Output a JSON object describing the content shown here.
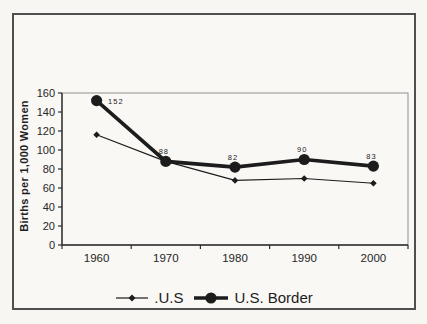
{
  "chart_data": {
    "type": "line",
    "categories": [
      "1960",
      "1970",
      "1980",
      "1990",
      "2000"
    ],
    "series": [
      {
        "name": ".U.S",
        "values": [
          116,
          88,
          68,
          70,
          65
        ],
        "marker": "diamond",
        "line_width": 1.2,
        "show_labels": false
      },
      {
        "name": "U.S. Border",
        "values": [
          152,
          88,
          82,
          90,
          83
        ],
        "marker": "circle",
        "line_width": 3.6,
        "show_labels": true,
        "data_labels": [
          "152",
          "88",
          "82",
          "90",
          "83"
        ],
        "label_placement": [
          "right",
          "above",
          "above",
          "above",
          "above"
        ]
      }
    ],
    "title": "",
    "xlabel": "",
    "ylabel": "Births per 1,000 Women",
    "ylim": [
      0,
      160
    ],
    "yticks": [
      "0",
      "20",
      "40",
      "60",
      "80",
      "100",
      "120",
      "140",
      "160"
    ],
    "grid": false,
    "legend_position": "bottom",
    "colors": {
      "series": "#1c1c1c",
      "axis": "#2e2e2e",
      "plot_border": "#8f8f8f",
      "text": "#262626",
      "frame_border": "#4f4f4f",
      "page_bg": "#f7f6f2"
    }
  }
}
